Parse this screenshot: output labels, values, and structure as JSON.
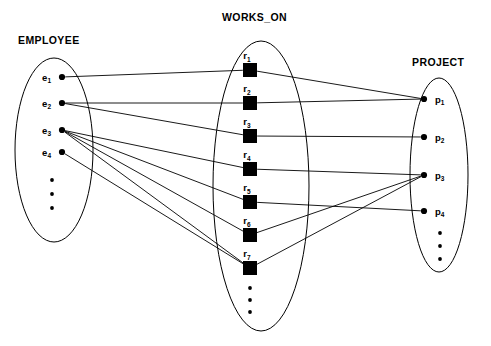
{
  "diagram": {
    "type": "er-set-mapping-diagram",
    "background": "#ffffff",
    "stroke_color": "#000000",
    "width": 491,
    "height": 346
  },
  "sets": {
    "employee": {
      "label": "EMPLOYEE",
      "label_x": 18,
      "label_y": 44,
      "ellipse": {
        "cx": 54,
        "cy": 150,
        "rx": 39,
        "ry": 92
      },
      "node_shape": "dot",
      "nodes": [
        {
          "id": "e1",
          "label": "e",
          "sub": "1",
          "x": 62,
          "y": 77
        },
        {
          "id": "e2",
          "label": "e",
          "sub": "2",
          "x": 62,
          "y": 103
        },
        {
          "id": "e3",
          "label": "e",
          "sub": "3",
          "x": 62,
          "y": 130
        },
        {
          "id": "e4",
          "label": "e",
          "sub": "4",
          "x": 62,
          "y": 152
        }
      ],
      "vertical_ellipsis": {
        "x": 52,
        "ys": [
          180,
          194,
          208
        ]
      }
    },
    "works_on": {
      "label": "WORKS_ON",
      "label_x": 222,
      "label_y": 21,
      "ellipse": {
        "cx": 261,
        "cy": 186,
        "rx": 48,
        "ry": 145
      },
      "node_shape": "square",
      "nodes": [
        {
          "id": "r1",
          "label": "r",
          "sub": "1",
          "x": 250,
          "y": 70
        },
        {
          "id": "r2",
          "label": "r",
          "sub": "2",
          "x": 250,
          "y": 103
        },
        {
          "id": "r3",
          "label": "r",
          "sub": "3",
          "x": 250,
          "y": 136
        },
        {
          "id": "r4",
          "label": "r",
          "sub": "4",
          "x": 250,
          "y": 169
        },
        {
          "id": "r5",
          "label": "r",
          "sub": "5",
          "x": 250,
          "y": 202
        },
        {
          "id": "r6",
          "label": "r",
          "sub": "6",
          "x": 250,
          "y": 235
        },
        {
          "id": "r7",
          "label": "r",
          "sub": "7",
          "x": 250,
          "y": 268
        }
      ],
      "vertical_ellipsis": {
        "x": 250,
        "ys": [
          288,
          300,
          312
        ]
      }
    },
    "project": {
      "label": "PROJECT",
      "label_x": 412,
      "label_y": 66,
      "ellipse": {
        "cx": 439,
        "cy": 175,
        "rx": 29,
        "ry": 97
      },
      "node_shape": "dot",
      "nodes": [
        {
          "id": "p1",
          "label": "p",
          "sub": "1",
          "x": 424,
          "y": 99
        },
        {
          "id": "p2",
          "label": "p",
          "sub": "2",
          "x": 424,
          "y": 137
        },
        {
          "id": "p3",
          "label": "p",
          "sub": "3",
          "x": 424,
          "y": 175
        },
        {
          "id": "p4",
          "label": "p",
          "sub": "4",
          "x": 424,
          "y": 211
        }
      ],
      "vertical_ellipsis": {
        "x": 440,
        "ys": [
          233,
          246,
          259
        ]
      }
    }
  },
  "edges": {
    "employee_to_works_on": [
      {
        "from": "e1",
        "to": "r1"
      },
      {
        "from": "e2",
        "to": "r2"
      },
      {
        "from": "e2",
        "to": "r3"
      },
      {
        "from": "e3",
        "to": "r4"
      },
      {
        "from": "e3",
        "to": "r5"
      },
      {
        "from": "e3",
        "to": "r6"
      },
      {
        "from": "e3",
        "to": "r7"
      },
      {
        "from": "e4",
        "to": "r7"
      }
    ],
    "works_on_to_project": [
      {
        "from": "r1",
        "to": "p1"
      },
      {
        "from": "r2",
        "to": "p1"
      },
      {
        "from": "r3",
        "to": "p2"
      },
      {
        "from": "r4",
        "to": "p3"
      },
      {
        "from": "r5",
        "to": "p4"
      },
      {
        "from": "r6",
        "to": "p3"
      },
      {
        "from": "r7",
        "to": "p3"
      }
    ]
  }
}
